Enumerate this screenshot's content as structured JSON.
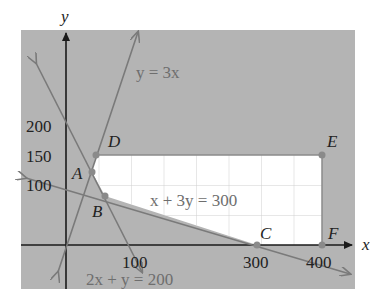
{
  "diagram": {
    "title": "",
    "colors": {
      "background": "#ffffff",
      "panel": "#b4b4b4",
      "feasible_region": "#ffffff",
      "grid": "#cfcfcf",
      "axis": "#1a1a1a",
      "constraint_line": "#7a7a7a",
      "point": "#8a8a8a",
      "equation_text": "#6e6e6e",
      "label_text": "#222222"
    },
    "axes": {
      "x_label": "x",
      "y_label": "y",
      "x_ticks": [
        "100",
        "300",
        "400"
      ],
      "y_ticks": [
        "100",
        "150",
        "200"
      ]
    },
    "equations": {
      "line1": "y = 3x",
      "line2": "x + 3y = 300",
      "line3": "2x + y = 200"
    },
    "points": [
      {
        "label": "A",
        "x": 40,
        "y": 120
      },
      {
        "label": "B",
        "x": 60,
        "y": 80
      },
      {
        "label": "C",
        "x": 300,
        "y": 0
      },
      {
        "label": "D",
        "x": 50,
        "y": 150
      },
      {
        "label": "E",
        "x": 400,
        "y": 150
      },
      {
        "label": "F",
        "x": 400,
        "y": 0
      }
    ]
  }
}
